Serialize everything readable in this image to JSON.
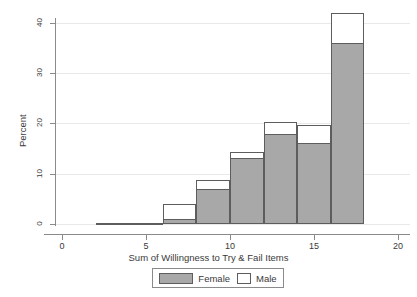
{
  "chart_data": {
    "type": "bar",
    "title": "",
    "subtitle": "",
    "xlabel": "Sum of Willingness to Try & Fail Items",
    "ylabel": "Percent",
    "xlim": [
      -1,
      20.8
    ],
    "ylim": [
      0,
      43.5
    ],
    "xticks": [
      0,
      5,
      10,
      15,
      20
    ],
    "xtick_labels": [
      "0",
      "5",
      "10",
      "15",
      "20"
    ],
    "yticks": [
      0,
      10,
      20,
      30,
      40
    ],
    "ytick_labels": [
      "0",
      "10",
      "20",
      "30",
      "40"
    ],
    "grid": "horizontal",
    "legend_position": "bottom-center",
    "bin_width": 2,
    "stacked": true,
    "categories": [
      "2-4",
      "4-6",
      "6-8",
      "8-10",
      "10-12",
      "12-14",
      "14-16",
      "16-18"
    ],
    "bin_starts": [
      2,
      4,
      6,
      8,
      10,
      12,
      14,
      16
    ],
    "bin_ends": [
      4,
      6,
      8,
      10,
      12,
      14,
      16,
      18
    ],
    "series": [
      {
        "name": "Female",
        "color": "#a8a8a8",
        "values": [
          0.2,
          0.2,
          1.0,
          7.0,
          13.2,
          18.0,
          16.1,
          36.0
        ]
      },
      {
        "name": "Male",
        "color": "#ffffff",
        "values": [
          0.0,
          0.0,
          3.0,
          1.7,
          1.2,
          2.2,
          3.7,
          6.0
        ]
      }
    ],
    "totals": [
      0.2,
      0.2,
      4.0,
      8.7,
      14.4,
      20.2,
      19.8,
      42.0
    ]
  },
  "legend": {
    "items": [
      {
        "label": "Female",
        "swatch": "filled-grey-swatch"
      },
      {
        "label": "Male",
        "swatch": "empty-white-swatch"
      }
    ]
  }
}
